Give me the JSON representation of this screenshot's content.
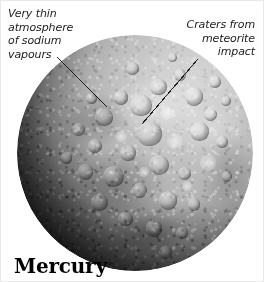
{
  "figure": {
    "caption": "Mercury",
    "background_color": "#ffffff",
    "text_color": "#1b1b1b"
  },
  "callouts": [
    {
      "id": "atmosphere",
      "text": "Very thin\natmosphere\nof sodium\nvapours",
      "align": "left"
    },
    {
      "id": "craters",
      "text": "Craters from\nmeteorite\nimpact",
      "align": "right"
    }
  ],
  "leader_lines": [
    {
      "id": "atmosphere-leader",
      "x1": 56,
      "y1": 56,
      "x2": 106,
      "y2": 106
    },
    {
      "id": "craters-leader",
      "x1": 197,
      "y1": 58,
      "x2": 141,
      "y2": 123
    }
  ],
  "planet": {
    "name": "Mercury",
    "center_x": 134,
    "center_y": 152,
    "radius": 118,
    "light_direction": "upper-right",
    "surface_colors": {
      "highlight": "#d9d9d9",
      "midtone": "#a6a6a6",
      "shadow": "#2a2a2a",
      "limb": "#080808"
    },
    "craters": [
      {
        "x": 60.0,
        "y": 22.0,
        "d": 7.0,
        "type": "normal"
      },
      {
        "x": 69.0,
        "y": 17.0,
        "d": 5.0,
        "type": "normal"
      },
      {
        "x": 52.5,
        "y": 30.0,
        "d": 9.0,
        "type": "normal"
      },
      {
        "x": 63.5,
        "y": 33.0,
        "d": 6.0,
        "type": "bright"
      },
      {
        "x": 75.0,
        "y": 26.0,
        "d": 8.0,
        "type": "normal"
      },
      {
        "x": 82.0,
        "y": 33.5,
        "d": 5.5,
        "type": "normal"
      },
      {
        "x": 44.0,
        "y": 26.5,
        "d": 6.0,
        "type": "normal"
      },
      {
        "x": 37.0,
        "y": 35.0,
        "d": 7.5,
        "type": "normal"
      },
      {
        "x": 56.0,
        "y": 42.0,
        "d": 10.5,
        "type": "normal"
      },
      {
        "x": 67.0,
        "y": 45.0,
        "d": 6.5,
        "type": "bright"
      },
      {
        "x": 77.5,
        "y": 41.0,
        "d": 8.0,
        "type": "normal"
      },
      {
        "x": 87.0,
        "y": 45.5,
        "d": 5.0,
        "type": "normal"
      },
      {
        "x": 47.0,
        "y": 50.0,
        "d": 7.0,
        "type": "normal"
      },
      {
        "x": 33.0,
        "y": 47.0,
        "d": 6.0,
        "type": "normal"
      },
      {
        "x": 60.0,
        "y": 55.0,
        "d": 8.5,
        "type": "normal"
      },
      {
        "x": 71.0,
        "y": 58.5,
        "d": 5.5,
        "type": "normal"
      },
      {
        "x": 81.0,
        "y": 54.0,
        "d": 7.0,
        "type": "bright"
      },
      {
        "x": 89.0,
        "y": 60.0,
        "d": 4.5,
        "type": "normal"
      },
      {
        "x": 41.0,
        "y": 60.0,
        "d": 9.0,
        "type": "normal"
      },
      {
        "x": 52.0,
        "y": 66.0,
        "d": 6.5,
        "type": "normal"
      },
      {
        "x": 64.0,
        "y": 70.0,
        "d": 8.0,
        "type": "normal"
      },
      {
        "x": 75.0,
        "y": 72.0,
        "d": 5.5,
        "type": "normal"
      },
      {
        "x": 29.0,
        "y": 58.0,
        "d": 6.5,
        "type": "normal"
      },
      {
        "x": 35.0,
        "y": 71.0,
        "d": 7.5,
        "type": "normal"
      },
      {
        "x": 46.0,
        "y": 78.0,
        "d": 6.0,
        "type": "normal"
      },
      {
        "x": 58.0,
        "y": 82.0,
        "d": 7.0,
        "type": "normal"
      },
      {
        "x": 70.0,
        "y": 84.0,
        "d": 5.0,
        "type": "normal"
      },
      {
        "x": 26.0,
        "y": 40.0,
        "d": 5.5,
        "type": "normal"
      },
      {
        "x": 84.0,
        "y": 20.0,
        "d": 5.0,
        "type": "normal"
      },
      {
        "x": 49.0,
        "y": 14.0,
        "d": 5.5,
        "type": "normal"
      },
      {
        "x": 66.0,
        "y": 9.5,
        "d": 4.0,
        "type": "normal"
      },
      {
        "x": 72.0,
        "y": 64.0,
        "d": 4.0,
        "type": "bright"
      },
      {
        "x": 53.5,
        "y": 58.0,
        "d": 4.5,
        "type": "bright"
      },
      {
        "x": 44.0,
        "y": 43.0,
        "d": 5.0,
        "type": "bright"
      },
      {
        "x": 31.5,
        "y": 27.0,
        "d": 4.5,
        "type": "normal"
      },
      {
        "x": 88.5,
        "y": 28.0,
        "d": 4.0,
        "type": "normal"
      },
      {
        "x": 21.0,
        "y": 52.0,
        "d": 5.0,
        "type": "normal"
      },
      {
        "x": 63.0,
        "y": 92.0,
        "d": 5.5,
        "type": "normal"
      }
    ]
  }
}
